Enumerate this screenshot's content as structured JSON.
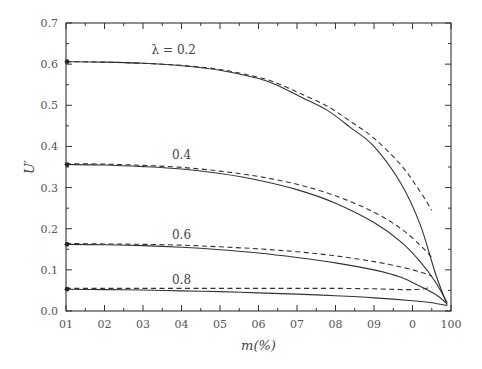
{
  "chart_data": {
    "type": "line",
    "title": "",
    "xlabel": "m(%)",
    "ylabel": "U′",
    "xlim": [
      0,
      100
    ],
    "ylim": [
      0.0,
      0.7
    ],
    "x_tick_values": [
      0,
      10,
      20,
      30,
      40,
      50,
      60,
      70,
      80,
      90,
      100
    ],
    "x_tick_labels": [
      "01",
      "02",
      "03",
      "04",
      "05",
      "06",
      "07",
      "08",
      "09",
      "0",
      "100"
    ],
    "y_tick_values": [
      0.0,
      0.1,
      0.2,
      0.3,
      0.4,
      0.5,
      0.6,
      0.7
    ],
    "y_tick_labels": [
      "0.0",
      "0.1",
      "0.2",
      "0.3",
      "0.4",
      "0.5",
      "0.6",
      "0.7"
    ],
    "grid": false,
    "legend": "none (curves labelled inline)",
    "series": [
      {
        "name": "λ = 0.2 (solid)",
        "style": "solid",
        "label": "λ = 0.2",
        "label_pos": [
          28,
          0.625
        ],
        "x": [
          0,
          10,
          20,
          30,
          40,
          50,
          55,
          61,
          68,
          74,
          80,
          87,
          92,
          96,
          99
        ],
        "y": [
          0.606,
          0.605,
          0.602,
          0.596,
          0.585,
          0.565,
          0.548,
          0.52,
          0.487,
          0.445,
          0.4,
          0.31,
          0.21,
          0.09,
          0.015
        ]
      },
      {
        "name": "λ = 0.2 (dashed)",
        "style": "dashed",
        "x": [
          0,
          10,
          20,
          30,
          40,
          50,
          55,
          61,
          68,
          74,
          80,
          87,
          92,
          95
        ],
        "y": [
          0.606,
          0.605,
          0.602,
          0.597,
          0.587,
          0.568,
          0.553,
          0.528,
          0.497,
          0.46,
          0.42,
          0.355,
          0.29,
          0.245
        ]
      },
      {
        "name": "λ = 0.4 (solid)",
        "style": "solid",
        "label": "0.4",
        "label_pos": [
          30,
          0.37
        ],
        "x": [
          0,
          10,
          20,
          30,
          40,
          50,
          60,
          70,
          80,
          87,
          92,
          96,
          99
        ],
        "y": [
          0.356,
          0.355,
          0.351,
          0.345,
          0.334,
          0.318,
          0.295,
          0.262,
          0.215,
          0.168,
          0.12,
          0.07,
          0.02
        ]
      },
      {
        "name": "λ = 0.4 (dashed)",
        "style": "dashed",
        "x": [
          0,
          10,
          20,
          30,
          40,
          50,
          60,
          70,
          80,
          87,
          92,
          95
        ],
        "y": [
          0.358,
          0.357,
          0.354,
          0.349,
          0.34,
          0.327,
          0.308,
          0.28,
          0.24,
          0.2,
          0.16,
          0.13
        ]
      },
      {
        "name": "λ = 0.6 (solid)",
        "style": "solid",
        "label": "0.6",
        "label_pos": [
          30,
          0.175
        ],
        "x": [
          0,
          10,
          20,
          30,
          40,
          50,
          60,
          70,
          80,
          87,
          92,
          96,
          99
        ],
        "y": [
          0.162,
          0.161,
          0.159,
          0.155,
          0.149,
          0.141,
          0.13,
          0.117,
          0.1,
          0.082,
          0.06,
          0.04,
          0.018
        ]
      },
      {
        "name": "λ = 0.6 (dashed)",
        "style": "dashed",
        "x": [
          0,
          10,
          20,
          30,
          40,
          50,
          60,
          70,
          80,
          87,
          92,
          95
        ],
        "y": [
          0.164,
          0.163,
          0.162,
          0.16,
          0.156,
          0.151,
          0.144,
          0.134,
          0.12,
          0.107,
          0.095,
          0.085
        ]
      },
      {
        "name": "λ = 0.8 (solid)",
        "style": "solid",
        "label": "0.8",
        "label_pos": [
          30,
          0.066
        ],
        "x": [
          0,
          10,
          20,
          30,
          40,
          50,
          60,
          70,
          80,
          90,
          95,
          99
        ],
        "y": [
          0.053,
          0.052,
          0.051,
          0.049,
          0.047,
          0.044,
          0.041,
          0.037,
          0.032,
          0.025,
          0.02,
          0.013
        ]
      },
      {
        "name": "λ = 0.8 (dashed)",
        "style": "dashed",
        "x": [
          0,
          10,
          20,
          30,
          40,
          50,
          60,
          70,
          80,
          88,
          92,
          95
        ],
        "y": [
          0.055,
          0.055,
          0.055,
          0.055,
          0.055,
          0.055,
          0.055,
          0.055,
          0.054,
          0.052,
          0.053,
          0.058
        ]
      }
    ]
  }
}
